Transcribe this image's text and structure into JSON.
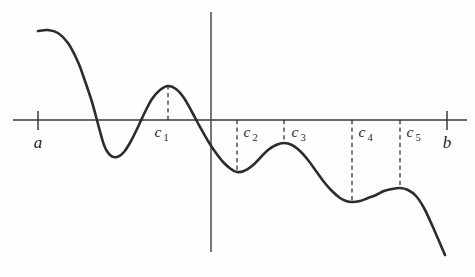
{
  "figure": {
    "background_color": "#fefefe",
    "curve_color": "#2e2b2b",
    "axis_color": "#3a3a3a",
    "dash_color": "#2e2b2b"
  },
  "labels": {
    "endpoint_left": "a",
    "endpoint_right": "b",
    "c1_base": "c",
    "c1_sub": "1",
    "c2_base": "c",
    "c2_sub": "2",
    "c3_base": "c",
    "c3_sub": "3",
    "c4_base": "c",
    "c4_sub": "4",
    "c5_base": "c",
    "c5_sub": "5"
  },
  "chart_data": {
    "type": "line",
    "xlabel": "",
    "ylabel": "",
    "grid": false,
    "legend": null,
    "axis": {
      "horizontal_axis_y_px": 120,
      "horizontal_axis_x_start_px": 13,
      "horizontal_axis_x_end_px": 467,
      "vertical_axis_x_px": 211,
      "vertical_axis_y_top_px": 12,
      "vertical_axis_y_bottom_px": 252
    },
    "ticks": [
      {
        "label": "a",
        "x_px": 38,
        "y_px": 120
      },
      {
        "label": "b",
        "x_px": 447,
        "y_px": 120
      }
    ],
    "critical_points": [
      {
        "name": "c1",
        "kind": "local maximum",
        "x_px": 168,
        "y_px": 86,
        "dashed_from_y_px": 120,
        "label_x_px": 158,
        "label_y_px": 137
      },
      {
        "name": "c2",
        "kind": "local minimum",
        "x_px": 237,
        "y_px": 172,
        "dashed_from_y_px": 120,
        "label_x_px": 241,
        "label_y_px": 137
      },
      {
        "name": "c3",
        "kind": "local maximum",
        "x_px": 284,
        "y_px": 143,
        "dashed_from_y_px": 120,
        "label_x_px": 289,
        "label_y_px": 137
      },
      {
        "name": "c4",
        "kind": "local minimum",
        "x_px": 352,
        "y_px": 202,
        "dashed_from_y_px": 120,
        "label_x_px": 356,
        "label_y_px": 137
      },
      {
        "name": "c5",
        "kind": "local maximum",
        "x_px": 400,
        "y_px": 188,
        "dashed_from_y_px": 120,
        "label_x_px": 404,
        "label_y_px": 137
      }
    ],
    "curve_points_px": [
      [
        38,
        31
      ],
      [
        48,
        30
      ],
      [
        58,
        33
      ],
      [
        68,
        43
      ],
      [
        78,
        62
      ],
      [
        85,
        81
      ],
      [
        92,
        102
      ],
      [
        98,
        124
      ],
      [
        104,
        145
      ],
      [
        110,
        155
      ],
      [
        117,
        157
      ],
      [
        124,
        152
      ],
      [
        131,
        141
      ],
      [
        138,
        127
      ],
      [
        145,
        112
      ],
      [
        152,
        99
      ],
      [
        160,
        90
      ],
      [
        168,
        86
      ],
      [
        176,
        89
      ],
      [
        184,
        98
      ],
      [
        192,
        112
      ],
      [
        200,
        127
      ],
      [
        208,
        141
      ],
      [
        216,
        153
      ],
      [
        224,
        163
      ],
      [
        231,
        169
      ],
      [
        237,
        172
      ],
      [
        244,
        171
      ],
      [
        252,
        166
      ],
      [
        260,
        158
      ],
      [
        268,
        150
      ],
      [
        276,
        145
      ],
      [
        284,
        143
      ],
      [
        292,
        145
      ],
      [
        300,
        151
      ],
      [
        308,
        160
      ],
      [
        316,
        171
      ],
      [
        324,
        182
      ],
      [
        332,
        191
      ],
      [
        340,
        198
      ],
      [
        346,
        201
      ],
      [
        352,
        202
      ],
      [
        360,
        201
      ],
      [
        368,
        198
      ],
      [
        376,
        195
      ],
      [
        384,
        191
      ],
      [
        392,
        189
      ],
      [
        400,
        188
      ],
      [
        408,
        190
      ],
      [
        416,
        196
      ],
      [
        424,
        208
      ],
      [
        432,
        225
      ],
      [
        439,
        241
      ],
      [
        445,
        255
      ]
    ],
    "curve_zero_crossings_px": [
      82,
      198
    ],
    "x_range_px": [
      13,
      467
    ],
    "y_range_px": [
      12,
      266
    ]
  }
}
